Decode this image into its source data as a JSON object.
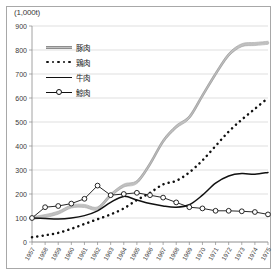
{
  "unit_label": "(1,000t)",
  "legend": {
    "position": "upper-left-inside",
    "entries": [
      {
        "label": "豚肉",
        "style": "thick-gray-band",
        "name": "legend-pork"
      },
      {
        "label": "鶏肉",
        "style": "dotted-black",
        "name": "legend-chicken"
      },
      {
        "label": "牛肉",
        "style": "solid-black",
        "name": "legend-beef"
      },
      {
        "label": "鯨肉",
        "style": "thin-black-circle-markers",
        "name": "legend-whale"
      }
    ]
  },
  "colors": {
    "pork": "#c0c0c0",
    "pork_edge": "#8e8e8e",
    "chicken": "#111111",
    "beef": "#111111",
    "whale": "#111111",
    "grid": "#c9c9c9",
    "axis": "#8a8a8a",
    "frame": "#a8a8a8",
    "background": "#ffffff"
  },
  "chart_data": {
    "type": "line",
    "title": "",
    "subtitle": "",
    "xlabel": "",
    "ylabel": "(1,000t)",
    "ylim": [
      0,
      900
    ],
    "ytick_step": 100,
    "yticks": [
      0,
      100,
      200,
      300,
      400,
      500,
      600,
      700,
      800,
      900
    ],
    "grid": true,
    "legend_position": "upper-left-inside",
    "categories": [
      "1957",
      "1958",
      "1959",
      "1960",
      "1961",
      "1962",
      "1963",
      "1964",
      "1965",
      "1966",
      "1967",
      "1968",
      "1969",
      "1970",
      "1971",
      "1972",
      "1973",
      "1974",
      "1975"
    ],
    "x": [
      1957,
      1958,
      1959,
      1960,
      1961,
      1962,
      1963,
      1964,
      1965,
      1966,
      1967,
      1968,
      1969,
      1970,
      1971,
      1972,
      1973,
      1974,
      1975
    ],
    "series": [
      {
        "name": "豚肉",
        "style": "thick-gray-band",
        "values": [
          100,
          108,
          122,
          148,
          150,
          140,
          195,
          235,
          250,
          325,
          420,
          480,
          520,
          610,
          700,
          780,
          820,
          825,
          830
        ]
      },
      {
        "name": "鶏肉",
        "style": "dotted-black",
        "values": [
          20,
          28,
          38,
          55,
          75,
          95,
          115,
          140,
          175,
          205,
          240,
          255,
          290,
          340,
          400,
          460,
          510,
          555,
          600
        ]
      },
      {
        "name": "牛肉",
        "style": "solid-black",
        "values": [
          100,
          98,
          96,
          100,
          110,
          130,
          165,
          190,
          175,
          160,
          150,
          145,
          155,
          195,
          245,
          275,
          285,
          282,
          290
        ]
      },
      {
        "name": "鯨肉",
        "style": "thin-black-circle-markers",
        "values": [
          100,
          145,
          150,
          160,
          180,
          235,
          195,
          200,
          205,
          195,
          185,
          165,
          145,
          140,
          130,
          130,
          128,
          125,
          115
        ]
      }
    ]
  }
}
